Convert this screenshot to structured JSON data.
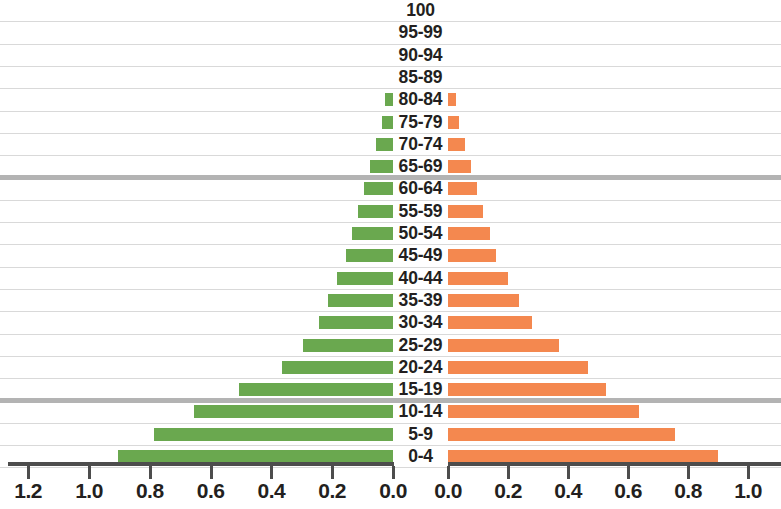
{
  "chart_data": {
    "type": "bar",
    "subtype": "population-pyramid",
    "title": "",
    "xlabel": "",
    "ylabel": "",
    "orientation": "horizontal",
    "grid": true,
    "legend": null,
    "categories": [
      "100",
      "95-99",
      "90-94",
      "85-89",
      "80-84",
      "75-79",
      "70-74",
      "65-69",
      "60-64",
      "55-59",
      "50-54",
      "45-49",
      "40-44",
      "35-39",
      "30-34",
      "25-29",
      "20-24",
      "15-19",
      "10-14",
      "5-9",
      "0-4"
    ],
    "series": [
      {
        "name": "left",
        "color": "#6aa84f",
        "axis": "left",
        "axis_label": "",
        "axis_ticks": [
          "1.2",
          "1.0",
          "0.8",
          "0.6",
          "0.4",
          "0.2",
          "0.0"
        ],
        "axis_tick_values": [
          1.2,
          1.0,
          0.8,
          0.6,
          0.4,
          0.2,
          0.0
        ],
        "axis_direction": "reversed",
        "xlim": [
          0.0,
          1.2
        ],
        "values": [
          0.0,
          0.0,
          0.0,
          0.0,
          0.025,
          0.035,
          0.055,
          0.075,
          0.095,
          0.115,
          0.135,
          0.155,
          0.185,
          0.215,
          0.245,
          0.295,
          0.365,
          0.505,
          0.655,
          0.785,
          0.905
        ]
      },
      {
        "name": "right",
        "color": "#f4884f",
        "axis": "right",
        "axis_label": "",
        "axis_ticks": [
          "0.0",
          "0.2",
          "0.4",
          "0.6",
          "0.8",
          "1.0"
        ],
        "axis_tick_values": [
          0.0,
          0.2,
          0.4,
          0.6,
          0.8,
          1.0
        ],
        "axis_direction": "normal",
        "xlim": [
          0.0,
          1.1
        ],
        "values": [
          0.0,
          0.0,
          0.0,
          0.0,
          0.025,
          0.035,
          0.055,
          0.075,
          0.095,
          0.115,
          0.14,
          0.16,
          0.2,
          0.235,
          0.28,
          0.37,
          0.465,
          0.525,
          0.635,
          0.755,
          0.9
        ]
      }
    ],
    "reference_lines": [
      {
        "after_category": "65-69",
        "color": "#b3b3b3"
      },
      {
        "after_category": "15-19",
        "color": "#b3b3b3"
      }
    ]
  }
}
